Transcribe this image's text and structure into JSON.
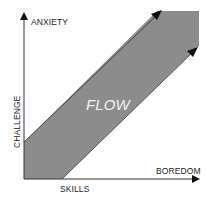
{
  "diagram": {
    "y_axis": {
      "label_top": "ANXIETY",
      "label_side": "CHALLENGE"
    },
    "x_axis": {
      "label_bottom": "SKILLS",
      "label_end": "BOREDOM"
    },
    "band_label": "FLOW",
    "colors": {
      "band": "#8c8c8c",
      "axis": "#222222",
      "flow_text": "#f2f2f2"
    }
  }
}
